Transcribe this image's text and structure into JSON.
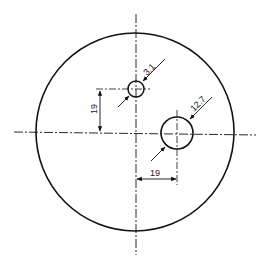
{
  "diagram": {
    "title": "",
    "colors": {
      "line": "#111111",
      "background": "#ffffff"
    },
    "outer_circle": {
      "cx": 135,
      "cy": 132,
      "r": 99
    },
    "small_hole": {
      "cx": 136,
      "cy": 89,
      "r": 8,
      "diameter_label": "3.1"
    },
    "large_hole": {
      "cx": 177,
      "cy": 133,
      "r": 16,
      "diameter_label": "12.7"
    },
    "dimensions": {
      "vertical_offset_label": "19",
      "horizontal_offset_label": "19"
    }
  }
}
